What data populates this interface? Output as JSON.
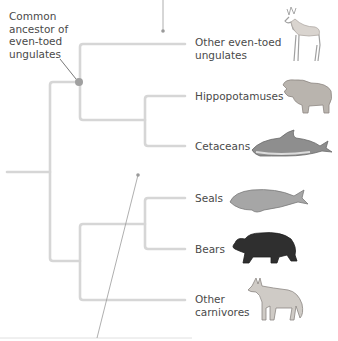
{
  "diagram": {
    "type": "phylogenetic-tree",
    "annotation": {
      "lines": [
        "Common",
        "ancestor of",
        "even-toed",
        "ungulates"
      ]
    },
    "taxa": [
      {
        "id": "other-even-toed-ungulates",
        "label_lines": [
          "Other even-toed",
          "ungulates"
        ],
        "icon": "deer-icon"
      },
      {
        "id": "hippopotamuses",
        "label_lines": [
          "Hippopotamuses"
        ],
        "icon": "hippopotamus-icon"
      },
      {
        "id": "cetaceans",
        "label_lines": [
          "Cetaceans"
        ],
        "icon": "dolphin-icon"
      },
      {
        "id": "seals",
        "label_lines": [
          "Seals"
        ],
        "icon": "seal-icon"
      },
      {
        "id": "bears",
        "label_lines": [
          "Bears"
        ],
        "icon": "bear-icon"
      },
      {
        "id": "other-carnivores",
        "label_lines": [
          "Other",
          "carnivores"
        ],
        "icon": "coyote-icon"
      }
    ],
    "colors": {
      "branch": "#d4d4d4",
      "node_dot": "#9e9e9e",
      "pointer": "#7a7a7a",
      "text": "#4a4a4a"
    }
  }
}
